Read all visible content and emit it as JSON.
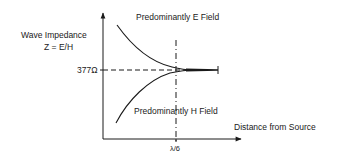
{
  "diagram": {
    "y_axis": {
      "label_line1": "Wave Impedance",
      "label_line2": "Z = E/H",
      "reference_tick": "377Ω"
    },
    "x_axis": {
      "label": "Distance from Source",
      "reference_tick": "λ/6"
    },
    "regions": {
      "upper": "Predominantly E Field",
      "lower": "Predominantly H Field"
    },
    "colors": {
      "line": "#1a1a1a",
      "background": "#ffffff"
    }
  }
}
